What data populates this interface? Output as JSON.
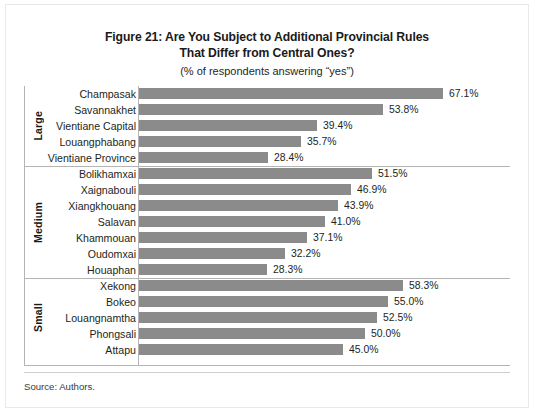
{
  "figure": {
    "title_lines": [
      "Figure 21: Are You Subject to Additional Provincial Rules",
      "That Differ from Central Ones?"
    ],
    "subtitle": "(% of respondents answering “yes”)",
    "source": "Source: Authors."
  },
  "colors": {
    "bar": "#8b8b8b",
    "axis": "#b4b4b4",
    "text": "#231f20",
    "background": "#ffffff"
  },
  "chart_data": {
    "type": "bar",
    "orientation": "horizontal",
    "title": "Figure 21: Are You Subject to Additional Provincial Rules That Differ from Central Ones?",
    "subtitle": "(% of respondents answering “yes”)",
    "xlabel": "",
    "ylabel": "",
    "xlim": [
      0,
      70
    ],
    "grid": false,
    "legend": null,
    "value_suffix": "%",
    "source": "Source: Authors.",
    "groups": [
      {
        "label": "Large",
        "categories": [
          "Champasak",
          "Savannakhet",
          "Vientiane Capital",
          "Louangphabang",
          "Vientiane Province"
        ],
        "values": [
          67.1,
          53.8,
          39.4,
          35.7,
          28.4
        ],
        "value_labels": [
          "67.1%",
          "53.8%",
          "39.4%",
          "35.7%",
          "28.4%"
        ]
      },
      {
        "label": "Medium",
        "categories": [
          "Bolikhamxai",
          "Xaignabouli",
          "Xiangkhouang",
          "Salavan",
          "Khammouan",
          "Oudomxai",
          "Houaphan"
        ],
        "values": [
          51.5,
          46.9,
          43.9,
          41.0,
          37.1,
          32.2,
          28.3
        ],
        "value_labels": [
          "51.5%",
          "46.9%",
          "43.9%",
          "41.0%",
          "37.1%",
          "32.2%",
          "28.3%"
        ]
      },
      {
        "label": "Small",
        "categories": [
          "Xekong",
          "Bokeo",
          "Louangnamtha",
          "Phongsali",
          "Attapu"
        ],
        "values": [
          58.3,
          55.0,
          52.5,
          50.0,
          45.0
        ],
        "value_labels": [
          "58.3%",
          "55.0%",
          "52.5%",
          "50.0%",
          "45.0%"
        ]
      }
    ]
  }
}
